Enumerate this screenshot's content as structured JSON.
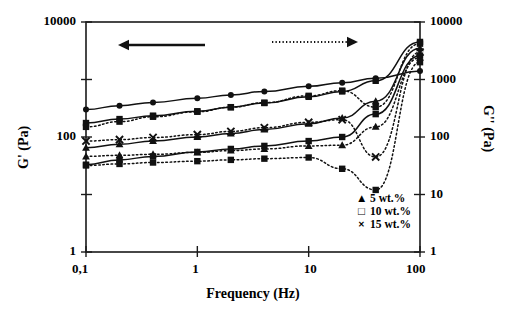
{
  "chart_data": {
    "type": "line",
    "title": "",
    "xlabel": "Frequency (Hz)",
    "ylabel_left": "G' (Pa)",
    "ylabel_right": "G'' (Pa)",
    "xscale": "log",
    "yscale": "log",
    "xlim": [
      0.1,
      100
    ],
    "ylim": [
      1,
      10000
    ],
    "grid": false,
    "x_ticks": [
      "0,1",
      "1",
      "10",
      "100"
    ],
    "x_tick_values": [
      0.1,
      1,
      10,
      100
    ],
    "y_ticks_left": [
      "10000",
      "100",
      "1"
    ],
    "y_tick_values_left": [
      10000,
      100,
      1
    ],
    "y_ticks_right": [
      "10000",
      "1000",
      "100",
      "10",
      "1"
    ],
    "y_tick_values_right": [
      10000,
      1000,
      100,
      10,
      1
    ],
    "annotations": [
      {
        "name": "left-arrow",
        "text": "",
        "style": "solid",
        "direction": "left",
        "meaning": "G' uses left axis"
      },
      {
        "name": "right-arrow",
        "text": "",
        "style": "dotted",
        "direction": "right",
        "meaning": "G'' uses right axis"
      }
    ],
    "legend": {
      "position": "inside-bottom-right",
      "entries": [
        {
          "label": "5 wt.%",
          "marker": "filled-triangle"
        },
        {
          "label": "10 wt.%",
          "marker": "open-square"
        },
        {
          "label": "15 wt.%",
          "marker": "cross"
        }
      ]
    },
    "series": [
      {
        "name": "G' 15 wt.%",
        "property": "G'",
        "axis": "left",
        "line": "solid",
        "marker": "filled-circle",
        "x": [
          0.1,
          0.2,
          0.4,
          1,
          2,
          4,
          10,
          20,
          40,
          100
        ],
        "y": [
          300,
          350,
          400,
          470,
          540,
          620,
          760,
          880,
          1050,
          1400
        ]
      },
      {
        "name": "G' 10 wt.%",
        "property": "G'",
        "axis": "left",
        "line": "solid",
        "marker": "filled-square",
        "x": [
          0.1,
          0.2,
          0.4,
          1,
          2,
          4,
          10,
          20,
          40,
          100
        ],
        "y": [
          175,
          205,
          235,
          280,
          330,
          390,
          500,
          620,
          950,
          4500
        ]
      },
      {
        "name": "G'' 10 wt.%",
        "property": "G''",
        "axis": "right",
        "line": "dotted",
        "marker": "filled-square",
        "x": [
          0.1,
          0.2,
          0.4,
          1,
          2,
          4,
          10,
          20,
          40,
          100
        ],
        "y": [
          150,
          185,
          225,
          275,
          330,
          395,
          520,
          640,
          330,
          4200
        ]
      },
      {
        "name": "G' 5 wt.%",
        "property": "G'",
        "axis": "left",
        "line": "solid",
        "marker": "filled-triangle",
        "x": [
          0.1,
          0.2,
          0.4,
          1,
          2,
          4,
          10,
          20,
          40,
          100
        ],
        "y": [
          65,
          75,
          85,
          100,
          115,
          135,
          170,
          215,
          420,
          3500
        ]
      },
      {
        "name": "G'' 5 wt.%",
        "property": "G''",
        "axis": "right",
        "line": "dotted",
        "marker": "cross",
        "x": [
          0.1,
          0.2,
          0.4,
          1,
          2,
          4,
          10,
          20,
          40,
          100
        ],
        "y": [
          85,
          90,
          98,
          110,
          125,
          145,
          180,
          200,
          45,
          3000
        ]
      },
      {
        "name": "G' series-4",
        "property": "G'",
        "axis": "left",
        "line": "solid",
        "marker": "filled-square",
        "x": [
          0.1,
          0.2,
          0.4,
          1,
          2,
          4,
          10,
          20,
          40,
          100
        ],
        "y": [
          33,
          40,
          46,
          55,
          62,
          70,
          85,
          100,
          250,
          2600
        ]
      },
      {
        "name": "G'' series-4",
        "property": "G''",
        "axis": "right",
        "line": "dotted",
        "marker": "filled-triangle",
        "x": [
          0.1,
          0.2,
          0.4,
          1,
          2,
          4,
          10,
          20,
          40,
          100
        ],
        "y": [
          46,
          48,
          50,
          54,
          58,
          62,
          70,
          72,
          150,
          2400
        ]
      },
      {
        "name": "G'' series-5",
        "property": "G''",
        "axis": "right",
        "line": "dotted",
        "marker": "filled-square",
        "x": [
          0.1,
          0.2,
          0.4,
          1,
          2,
          4,
          10,
          20,
          40,
          100
        ],
        "y": [
          32,
          34,
          36,
          38,
          40,
          42,
          44,
          28,
          12,
          2000
        ]
      }
    ]
  }
}
